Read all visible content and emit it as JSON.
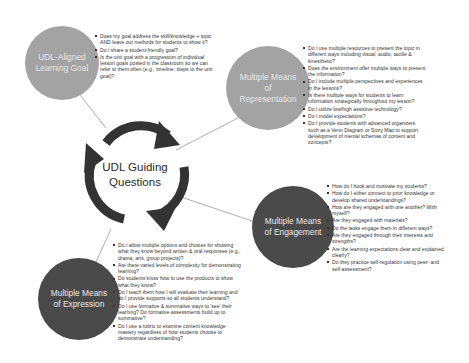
{
  "diagram": {
    "hub": {
      "line1": "UDL Guiding",
      "line2": "Questions"
    },
    "colors": {
      "light_node": "#a3a3a3",
      "dark_node": "#4a4a4a",
      "arrows": "#333333",
      "connector": "#8a8a8a"
    },
    "nodes": [
      {
        "id": "learning-goal",
        "title_lines": [
          "UDL-Aligned",
          "Learning Goal"
        ],
        "questions": [
          "Does my goal address the skill/knowledge + topic AND leave out methods for students to show it?",
          "Do I share a student-friendly goal?",
          "Is the unit goal with a progression of individual lesson goals posted in the classroom so we can refer to them often (e.g., timeline, steps to the unit goal)?"
        ]
      },
      {
        "id": "representation",
        "title_lines": [
          "Multiple Means",
          "of",
          "Representation"
        ],
        "questions": [
          "Do I use multiple resources to present the topic in different ways including visual, audio, tactile & kinesthetic?",
          "Does the environment offer multiple ways to present the information?",
          "Do I include multiple perspectives and experiences in the lessons?",
          "Is there multiple ways for students to learn information strategically throughout my lesson?",
          "Do I utilize low/high assistive technology?",
          "Do I model expectations?",
          "Do I provide students with advanced organizers such as a Venn Diagram or Story Map to support development of mental schemas of content and concepts?"
        ]
      },
      {
        "id": "engagement",
        "title_lines": [
          "Multiple Means",
          "of Engagement"
        ],
        "questions": [
          "How do I hook and motivate my students?",
          "How do I either connect to prior knowledge or develop shared understandings?",
          "How are they engaged with one another? With myself?",
          "Are they engaged with materials?",
          "Do the tasks engage them in different ways?",
          "Are they engaged through their interests and strengths?",
          "Are the learning expectations clear and explained clearly?",
          "Do they practice self-regulation using peer- and self-assessment?"
        ]
      },
      {
        "id": "expression",
        "title_lines": [
          "Multiple Means",
          "of Expression"
        ],
        "questions": [
          "Do I allow multiple options and choices for showing what they know beyond written & oral responses (e.g., drama, arts, group projects)?",
          "Are there varied levels of complexity for demonstrating learning?",
          "Do students know how to use the products to show what they know?",
          "Do I teach them how I will evaluate their learning and do I provide supports so all students understand?",
          "Do I use formative & summative ways to 'see' their learning? Do formative assessments build up to summative?",
          "Do I use a rubric to examine content knowledge mastery regardless of how students choose to demonstrate understanding?"
        ]
      }
    ]
  }
}
